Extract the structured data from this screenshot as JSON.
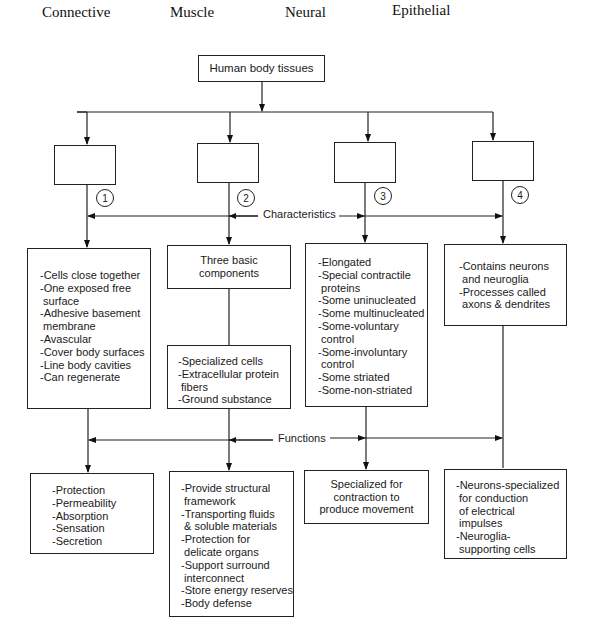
{
  "headers": [
    "Connective",
    "Muscle",
    "Neural",
    "Epithelial"
  ],
  "root": {
    "label": "Human body tissues"
  },
  "blank_boxes": [
    "",
    "",
    "",
    ""
  ],
  "markers": [
    "1",
    "2",
    "3",
    "4"
  ],
  "connectors": {
    "characteristics": "Characteristics",
    "functions": "Functions"
  },
  "characteristics": {
    "col1": [
      "-Cells close together",
      "-One exposed free",
      " surface",
      "-Adhesive basement",
      " membrane",
      "-Avascular",
      "-Cover body surfaces",
      "-Line body cavities",
      "-Can regenerate"
    ],
    "col2_title": [
      "Three basic",
      "components"
    ],
    "col2_items": [
      "-Specialized cells",
      "-Extracellular protein",
      " fibers",
      "-Ground substance"
    ],
    "col3": [
      "-Elongated",
      "-Special contractile",
      " proteins",
      "-Some uninucleated",
      "-Some multinucleated",
      "-Some-voluntary",
      " control",
      "-Some-involuntary",
      " control",
      "-Some striated",
      "-Some-non-striated"
    ],
    "col4": [
      "-Contains neurons",
      " and neuroglia",
      "-Processes called",
      " axons & dendrites"
    ]
  },
  "functions": {
    "col1": [
      "-Protection",
      "-Permeability",
      "-Absorption",
      "-Sensation",
      "-Secretion"
    ],
    "col2": [
      "-Provide structural",
      " framework",
      "-Transporting fluids",
      " & soluble materials",
      "-Protection for",
      " delicate organs",
      "-Support surround",
      " interconnect",
      "-Store energy reserves",
      "-Body defense"
    ],
    "col3": [
      "Specialized for",
      "contraction to",
      "produce movement"
    ],
    "col4": [
      "-Neurons-specialized",
      " for conduction",
      " of electrical",
      " impulses",
      "-Neuroglia-",
      " supporting cells"
    ]
  }
}
